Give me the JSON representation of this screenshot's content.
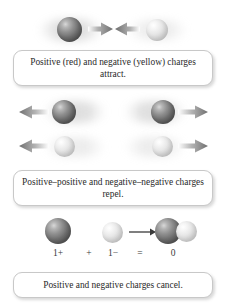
{
  "figure": {
    "background_color": "#ffffff",
    "sphere_colors": {
      "positive_label": "red",
      "negative_label": "yellow",
      "positive_render": "#6f6f6f",
      "negative_render": "#e4e4e4"
    }
  },
  "panels": [
    {
      "id": "attract",
      "caption": "Positive (red) and negative (yellow) charges attract.",
      "caption_lines": [
        "Positive (red) and negative (yellow)",
        "charges attract."
      ]
    },
    {
      "id": "repel",
      "caption": "Positive–positive and negative–negative charges repel.",
      "caption_lines": [
        "Positive–positive and negative–",
        "negative charges repel."
      ]
    },
    {
      "id": "cancel",
      "caption": "Positive and negative charges cancel.",
      "caption_lines": [
        "Positive and negative charges cancel."
      ]
    }
  ],
  "equation": {
    "terms": [
      {
        "symbol": "1+",
        "name": "positive-charge-value"
      },
      {
        "symbol": "+",
        "name": "plus-operator"
      },
      {
        "symbol": "1−",
        "name": "negative-charge-value"
      },
      {
        "symbol": "=",
        "name": "equals-operator"
      },
      {
        "symbol": "0",
        "name": "net-charge-value"
      }
    ]
  },
  "icons": {
    "arrow_right": "arrow-right-icon",
    "arrow_left": "arrow-left-icon",
    "sphere_positive": "sphere-positive-icon",
    "sphere_negative": "sphere-negative-icon",
    "reaction_arrow": "reaction-arrow-icon"
  }
}
